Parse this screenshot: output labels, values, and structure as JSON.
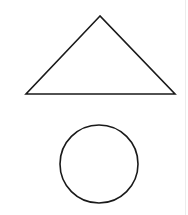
{
  "diagram": {
    "background": "#ffffff",
    "stroke_color": "#1a1a1a",
    "stroke_width": 1.6,
    "shapes": [
      {
        "type": "triangle",
        "name": "triangle",
        "points": [
          [
            100,
            16
          ],
          [
            26,
            94
          ],
          [
            175,
            94
          ]
        ]
      },
      {
        "type": "circle",
        "name": "circle",
        "cx": 99,
        "cy": 164,
        "r": 39
      }
    ],
    "edge_line_color": "#ececec"
  }
}
